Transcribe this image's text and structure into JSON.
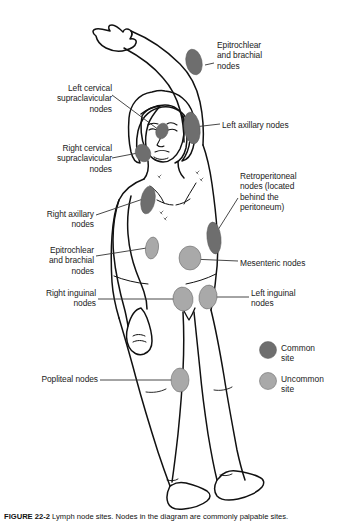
{
  "figure": {
    "caption_prefix": "FIGURE 22-2",
    "caption_text": "  Lymph node sites. Nodes in the diagram are commonly palpable sites."
  },
  "labels": [
    {
      "id": "epitrochlear-brachial-upper",
      "text": "Epitrochlear\nand brachial\nnodes",
      "align": "left",
      "x": 217,
      "y": 40,
      "width": 110
    },
    {
      "id": "left-cervical-supraclavicular",
      "text": "Left cervical\nsupraclavicular\nnodes",
      "align": "right",
      "x": 16,
      "y": 83,
      "width": 96
    },
    {
      "id": "left-axillary",
      "text": "Left axillary nodes",
      "align": "left",
      "x": 222,
      "y": 120,
      "width": 120
    },
    {
      "id": "right-cervical-supraclavicular",
      "text": "Right cervical\nsupraclavicular\nnodes",
      "align": "right",
      "x": 13,
      "y": 143,
      "width": 99
    },
    {
      "id": "retroperitoneal",
      "text": "Retroperitoneal\nnodes (located\nbehind the\nperitoneum)",
      "align": "left",
      "x": 240,
      "y": 171,
      "width": 104
    },
    {
      "id": "right-axillary",
      "text": "Right axillary\nnodes",
      "align": "right",
      "x": 18,
      "y": 209,
      "width": 76
    },
    {
      "id": "epitrochlear-brachial-lower",
      "text": "Epitrochlear\nand brachial\nnodes",
      "align": "right",
      "x": 18,
      "y": 245,
      "width": 76
    },
    {
      "id": "mesenteric",
      "text": "Mesenteric nodes",
      "align": "left",
      "x": 240,
      "y": 258,
      "width": 108
    },
    {
      "id": "left-inguinal",
      "text": "Left inguinal\nnodes",
      "align": "left",
      "x": 251,
      "y": 288,
      "width": 90
    },
    {
      "id": "right-inguinal",
      "text": "Right inguinal\nnodes",
      "align": "right",
      "x": 18,
      "y": 288,
      "width": 78
    },
    {
      "id": "popliteal",
      "text": "Popliteal nodes",
      "align": "right",
      "x": 22,
      "y": 374,
      "width": 76
    }
  ],
  "legend": {
    "items": [
      {
        "id": "common-site",
        "label": "Common\nsite",
        "color": "#6e6e6e",
        "cx": 268,
        "cy": 350,
        "r": 8.5,
        "label_x": 281,
        "label_y": 343
      },
      {
        "id": "uncommon-site",
        "label": "Uncommon\nsite",
        "color": "#a9a9a9",
        "cx": 268,
        "cy": 381,
        "r": 8.5,
        "label_x": 281,
        "label_y": 374
      }
    ]
  },
  "colors": {
    "common": "#6e6e6e",
    "uncommon": "#a9a9a9",
    "outline": "#111111",
    "leader": "#333333",
    "background": "#ffffff"
  },
  "nodes": [
    {
      "id": "node-epitrochlear-left-arm",
      "type": "common",
      "cx": 194,
      "cy": 62,
      "rx": 8,
      "ry": 13,
      "rot": -12
    },
    {
      "id": "node-left-axillary",
      "type": "common",
      "cx": 192,
      "cy": 128,
      "rx": 8,
      "ry": 16,
      "rot": -8
    },
    {
      "id": "node-left-cervical",
      "type": "common",
      "cx": 162,
      "cy": 131,
      "rx": 6,
      "ry": 8,
      "rot": 20
    },
    {
      "id": "node-right-cervical",
      "type": "common",
      "cx": 143,
      "cy": 153,
      "rx": 7.5,
      "ry": 9,
      "rot": -25
    },
    {
      "id": "node-right-axillary",
      "type": "common",
      "cx": 148,
      "cy": 200,
      "rx": 7,
      "ry": 14,
      "rot": 10
    },
    {
      "id": "node-retroperitoneal",
      "type": "common",
      "cx": 214,
      "cy": 238,
      "rx": 7,
      "ry": 16,
      "rot": -6
    },
    {
      "id": "node-epitrochlear-right",
      "type": "uncommon",
      "cx": 152,
      "cy": 248,
      "rx": 6.5,
      "ry": 11,
      "rot": 8
    },
    {
      "id": "node-mesenteric",
      "type": "uncommon",
      "cx": 190,
      "cy": 258,
      "rx": 11,
      "ry": 12,
      "rot": 0
    },
    {
      "id": "node-right-inguinal",
      "type": "uncommon",
      "cx": 183,
      "cy": 299,
      "rx": 10,
      "ry": 12,
      "rot": -8
    },
    {
      "id": "node-left-inguinal",
      "type": "uncommon",
      "cx": 208,
      "cy": 297,
      "rx": 9,
      "ry": 12,
      "rot": 8
    },
    {
      "id": "node-popliteal",
      "type": "uncommon",
      "cx": 180,
      "cy": 380,
      "rx": 9,
      "ry": 12,
      "rot": 0
    }
  ],
  "leaders": [
    {
      "id": "leader-epitrochlear-upper",
      "d": "M214,63 L205,65"
    },
    {
      "id": "leader-left-cervical",
      "d": "M112,95 L163,133"
    },
    {
      "id": "leader-left-axillary",
      "d": "M220,124 L194,127"
    },
    {
      "id": "leader-right-cervical",
      "d": "M112,158 L143,152"
    },
    {
      "id": "leader-retroperitoneal",
      "d": "M238,198 L216,233"
    },
    {
      "id": "leader-right-axillary",
      "d": "M96,215 L149,197"
    },
    {
      "id": "leader-epitrochlear-lower",
      "d": "M96,256 L153,247"
    },
    {
      "id": "leader-mesenteric",
      "d": "M238,261 L191,259"
    },
    {
      "id": "leader-left-inguinal",
      "d": "M249,297 L209,297"
    },
    {
      "id": "leader-right-inguinal",
      "d": "M98,299 L183,299"
    },
    {
      "id": "leader-popliteal",
      "d": "M100,380 L179,380"
    }
  ]
}
